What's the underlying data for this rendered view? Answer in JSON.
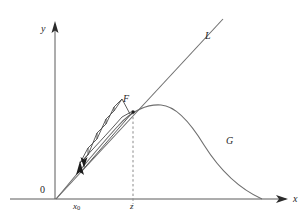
{
  "figure": {
    "background_color": "#ffffff",
    "width": 308,
    "height": 222,
    "axes": {
      "x_axis_label": "x",
      "y_axis_label": "y",
      "origin_label": "0",
      "x_axis_y_px": 199,
      "y_axis_x_px": 55,
      "x_axis_start_px": 10,
      "x_axis_end_px": 288,
      "y_axis_top_px": 22,
      "arrow_color": "#2b2b2b",
      "axis_color": "#5a5a5a"
    },
    "tick_labels": [
      {
        "name": "x0",
        "text": "x",
        "subscript": "0",
        "x_px": 80
      },
      {
        "name": "z",
        "text": "z",
        "subscript": "",
        "x_px": 133
      }
    ],
    "curves": [
      {
        "name": "G",
        "label": "G",
        "kind": "parabola",
        "description": "unimodal hump curve y = g(x) rising from origin to a maximum then falling back to the x-axis",
        "color": "#6e6e6e",
        "peak_px": [
          161,
          105
        ],
        "x_intercepts_px": [
          56,
          262
        ],
        "label_px": [
          226,
          136
        ]
      },
      {
        "name": "L",
        "label": "L",
        "kind": "line",
        "description": "diagonal identity line y = x through the origin",
        "color": "#6e6e6e",
        "start_px": [
          56,
          199
        ],
        "end_px": [
          223,
          19
        ],
        "label_px": [
          205,
          31
        ]
      }
    ],
    "points": [
      {
        "name": "F",
        "label": "F",
        "description": "fixed point where line L meets curve G",
        "x_px": 133,
        "y_px": 112,
        "label_px": [
          123,
          94
        ]
      }
    ],
    "guides": [
      {
        "name": "z-dropline",
        "style": "dashed",
        "color": "#8a8a8a",
        "from_px": [
          133,
          112
        ],
        "to_px": [
          133,
          199
        ]
      }
    ],
    "annotations": [
      {
        "name": "start-arrow",
        "kind": "up-arrow",
        "description": "vertical arrow at x0 on the x-axis pointing up toward the curve",
        "x_px": 80,
        "from_y_px": 198,
        "to_y_px": 162
      },
      {
        "name": "cobweb-direction-arrow",
        "kind": "down-arrow",
        "description": "small arrowhead on the first cobweb step indicating iteration direction",
        "x_px": 84,
        "y_px": 162
      }
    ],
    "cobweb": {
      "name": "staircase-iteration",
      "description": "staircase/cobweb path of successive iterates climbing between curve G and line L toward the fixed point F",
      "color": "#4a4a4a",
      "steps": 6
    },
    "colors": {
      "ink": "#262626",
      "axis": "#5a5a5a",
      "curve": "#6e6e6e",
      "cobweb": "#4a4a4a",
      "dashed": "#8a8a8a",
      "marker": "#1c1c1c"
    }
  }
}
